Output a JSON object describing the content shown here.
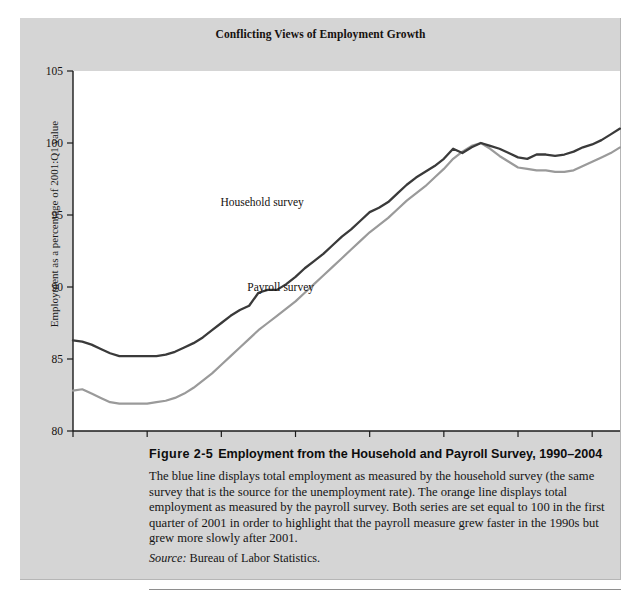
{
  "figure": {
    "chart_title": "Conflicting Views of Employment Growth",
    "caption_number": "Figure 2-5",
    "caption_title": "Employment from the Household and Payroll Survey, 1990–2004",
    "caption_body": "The blue line displays total employment as measured by the household survey (the same survey that is the source for the unemployment rate). The orange line displays total employment as measured by the payroll survey. Both series are set equal to 100 in the first quarter of 2001 in order to highlight that the payroll measure grew faster in the 1990s but grew more slowly after 2001.",
    "source_word": "Source:",
    "source_text": "Bureau of Labor Statistics."
  },
  "colors": {
    "panel_background": "#d5d5d5",
    "plot_background": "#ffffff",
    "household_line": "#3a3a3a",
    "payroll_line": "#9a9a9a",
    "axis": "#1a1a1a",
    "text": "#15110f"
  },
  "chart_data": {
    "type": "line",
    "title": "Conflicting Views of Employment Growth",
    "xlabel": "",
    "ylabel": "Employment as a percentage of 2001:Q1 value",
    "xlim": [
      1990,
      2004.75
    ],
    "ylim": [
      80,
      105
    ],
    "yticks": [
      80,
      85,
      90,
      95,
      100,
      105
    ],
    "xticks": [
      1990,
      1992,
      1994,
      1996,
      1998,
      2000,
      2002,
      2004
    ],
    "grid": false,
    "legend_position": "inline-annotations",
    "annotations": [
      {
        "text": "Household survey",
        "x": 1995.1,
        "y": 95.6
      },
      {
        "text": "Payroll survey",
        "x": 1995.6,
        "y": 89.7
      }
    ],
    "x": [
      1990,
      1990.25,
      1990.5,
      1990.75,
      1991,
      1991.25,
      1991.5,
      1991.75,
      1992,
      1992.25,
      1992.5,
      1992.75,
      1993,
      1993.25,
      1993.5,
      1993.75,
      1994,
      1994.25,
      1994.5,
      1994.75,
      1995,
      1995.25,
      1995.5,
      1995.75,
      1996,
      1996.25,
      1996.5,
      1996.75,
      1997,
      1997.25,
      1997.5,
      1997.75,
      1998,
      1998.25,
      1998.5,
      1998.75,
      1999,
      1999.25,
      1999.5,
      1999.75,
      2000,
      2000.25,
      2000.5,
      2000.75,
      2001,
      2001.25,
      2001.5,
      2001.75,
      2002,
      2002.25,
      2002.5,
      2002.75,
      2003,
      2003.25,
      2003.5,
      2003.75,
      2004,
      2004.25,
      2004.5,
      2004.75
    ],
    "series": [
      {
        "name": "Household survey",
        "color": "#3a3a3a",
        "values": [
          86.3,
          86.2,
          86.0,
          85.7,
          85.4,
          85.2,
          85.2,
          85.2,
          85.2,
          85.2,
          85.3,
          85.5,
          85.8,
          86.1,
          86.5,
          87.0,
          87.5,
          88.0,
          88.4,
          88.7,
          89.6,
          89.8,
          89.8,
          90.2,
          90.7,
          91.3,
          91.8,
          92.3,
          92.9,
          93.5,
          94.0,
          94.6,
          95.2,
          95.5,
          95.9,
          96.5,
          97.1,
          97.6,
          98.0,
          98.4,
          98.9,
          99.6,
          99.3,
          99.7,
          100.0,
          99.8,
          99.6,
          99.3,
          99.0,
          98.9,
          99.2,
          99.2,
          99.1,
          99.2,
          99.4,
          99.7,
          99.9,
          100.2,
          100.6,
          101.0
        ]
      },
      {
        "name": "Payroll survey",
        "color": "#9a9a9a",
        "values": [
          82.8,
          82.9,
          82.6,
          82.3,
          82.0,
          81.9,
          81.9,
          81.9,
          81.9,
          82.0,
          82.1,
          82.3,
          82.6,
          83.0,
          83.5,
          84.0,
          84.6,
          85.2,
          85.8,
          86.4,
          87.0,
          87.5,
          88.0,
          88.5,
          89.0,
          89.6,
          90.2,
          90.8,
          91.4,
          92.0,
          92.6,
          93.2,
          93.8,
          94.3,
          94.8,
          95.4,
          96.0,
          96.5,
          97.0,
          97.6,
          98.2,
          98.9,
          99.4,
          99.8,
          100.0,
          99.6,
          99.1,
          98.7,
          98.3,
          98.2,
          98.1,
          98.1,
          98.0,
          98.0,
          98.1,
          98.4,
          98.7,
          99.0,
          99.3,
          99.7
        ]
      }
    ]
  }
}
